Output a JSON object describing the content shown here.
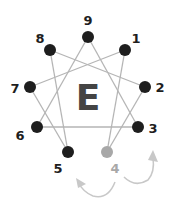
{
  "diagram": {
    "center_letter": "E",
    "colors": {
      "line": "#b5b5b5",
      "dot": "#1e1e1e",
      "highlight_dot": "#a8a8a8",
      "arrow": "#c8c8c8",
      "center_letter": "#444444"
    },
    "points": [
      {
        "label": "9",
        "x": 88,
        "y": 37
      },
      {
        "label": "1",
        "x": 125,
        "y": 50
      },
      {
        "label": "2",
        "x": 145,
        "y": 87
      },
      {
        "label": "3",
        "x": 138,
        "y": 127
      },
      {
        "label": "4",
        "x": 107,
        "y": 152,
        "highlighted": true
      },
      {
        "label": "5",
        "x": 68,
        "y": 152
      },
      {
        "label": "6",
        "x": 37,
        "y": 127
      },
      {
        "label": "7",
        "x": 30,
        "y": 87
      },
      {
        "label": "8",
        "x": 50,
        "y": 50
      }
    ],
    "connections": [
      [
        "9",
        "3"
      ],
      [
        "3",
        "6"
      ],
      [
        "6",
        "9"
      ],
      [
        "1",
        "4"
      ],
      [
        "4",
        "2"
      ],
      [
        "2",
        "8"
      ],
      [
        "8",
        "5"
      ],
      [
        "5",
        "7"
      ],
      [
        "7",
        "1"
      ]
    ],
    "arrows": [
      {
        "from": "4",
        "to": "5",
        "direction": "toward-5"
      },
      {
        "from": "4",
        "to": "3",
        "direction": "toward-3"
      }
    ]
  }
}
